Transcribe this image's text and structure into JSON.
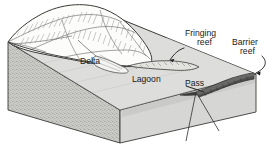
{
  "figure": {
    "type": "block-diagram",
    "style": "pen-and-ink line drawing",
    "width": 280,
    "height": 157,
    "background_color": "#ffffff",
    "ink_color": "#1a1a1a",
    "labels": {
      "fringing_reef": {
        "line1": "Fringing",
        "line2": "reef"
      },
      "barrier_reef": {
        "line1": "Barrier",
        "line2": "reef"
      },
      "delta": "Delta",
      "lagoon": "Lagoon",
      "pass": "Pass"
    },
    "colors": {
      "block_top_water": "#d8d8d6",
      "block_front_face": "#cfcfcd",
      "block_right_face": "#d9d9d7",
      "island_fill": "#fbfbfa",
      "reef_dark": "#4a4a48",
      "outline": "#3a3a38",
      "stipple": "#8d8d8a"
    },
    "features": [
      {
        "name": "island",
        "description": "eroded volcanic peak with hachured ridges and valleys"
      },
      {
        "name": "delta",
        "description": "alluvial fan where stream enters lagoon"
      },
      {
        "name": "lagoon",
        "description": "shallow water between island shore and barrier reef"
      },
      {
        "name": "fringing-reef",
        "description": "narrow reef hugging the island shoreline"
      },
      {
        "name": "barrier-reef",
        "description": "dark crescent reef ridge along the seaward margin"
      },
      {
        "name": "pass",
        "description": "channel cutting through the barrier reef opposite the delta"
      }
    ]
  }
}
